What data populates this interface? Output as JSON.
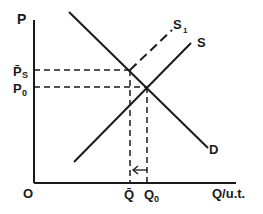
{
  "diagram": {
    "type": "supply-demand",
    "axes": {
      "y_label": "P",
      "x_label": "Q/u.t.",
      "origin_label": "O"
    },
    "curves": [
      {
        "id": "demand",
        "label": "D",
        "style": "solid"
      },
      {
        "id": "supply",
        "label": "S",
        "style": "solid"
      },
      {
        "id": "supply-shifted",
        "label": "S",
        "subscript": "1",
        "style": "dashed"
      }
    ],
    "price_levels": [
      {
        "id": "p-bar-s",
        "label": "P̄",
        "subscript": "S"
      },
      {
        "id": "p-zero",
        "label": "P",
        "subscript": "0"
      }
    ],
    "quantity_levels": [
      {
        "id": "q-bar",
        "label": "Q̄"
      },
      {
        "id": "q-zero",
        "label": "Q",
        "subscript": "0"
      }
    ],
    "arrow": {
      "from": "Q0",
      "to": "Q̄",
      "direction": "left"
    },
    "colors": {
      "ink": "#1a1a1a",
      "background": "#ffffff"
    }
  }
}
